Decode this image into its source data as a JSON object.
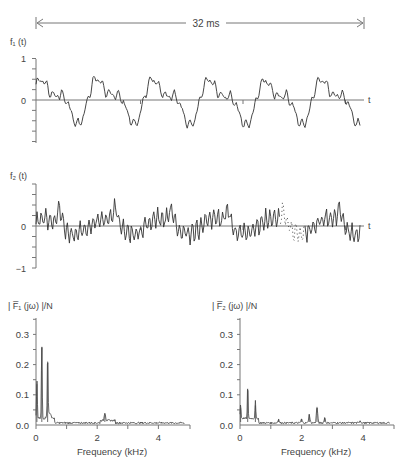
{
  "chart_data": [
    {
      "type": "line",
      "id": "f1",
      "title": "f1(t)",
      "ylabel": "f₁ (t)",
      "xlabel": "t",
      "duration_label": "32 ms",
      "duration_ms": 32,
      "ylim": [
        -1,
        1
      ],
      "yticks": [
        {
          "v": 1,
          "label": "1"
        },
        {
          "v": 0,
          "label": "0"
        }
      ],
      "minor_yticks": [
        0.75,
        0.5,
        0.25,
        -0.25,
        -0.5,
        -0.75,
        -1
      ],
      "xticks_ms": [
        10,
        20,
        30
      ],
      "periods": 6,
      "description": "quasi-periodic waveform, peaks ~0.6–0.75, troughs ~-0.55"
    },
    {
      "type": "line",
      "id": "f2",
      "title": "f2(t)",
      "ylabel": "f₂ (t)",
      "xlabel": "t",
      "ylim": [
        -1,
        1
      ],
      "yticks": [
        {
          "v": 0,
          "label": "0"
        },
        {
          "v": -1,
          "label": "−1"
        }
      ],
      "minor_yticks": [
        1,
        0.75,
        0.5,
        0.25,
        -0.25,
        -0.5,
        -0.75
      ],
      "xticks_ms": [
        10,
        20,
        30
      ],
      "periods": 6,
      "description": "noisy high-frequency waveform with spikes up to ~0.55, dotted gap near 24 ms"
    },
    {
      "type": "line",
      "id": "F1",
      "title": "|F̅₁(jω)|/N",
      "ylabel": "| F̅₁ (jω) |/N",
      "xlabel": "Frequency (kHz)",
      "xlim": [
        0,
        5
      ],
      "ylim": [
        0,
        0.35
      ],
      "xticks": [
        {
          "v": 0,
          "label": "0"
        },
        {
          "v": 2,
          "label": "2"
        },
        {
          "v": 4,
          "label": "4"
        }
      ],
      "yticks": [
        {
          "v": 0,
          "label": "0.0"
        },
        {
          "v": 0.1,
          "label": "0.1"
        },
        {
          "v": 0.2,
          "label": "0.2"
        },
        {
          "v": 0.3,
          "label": "0.3"
        }
      ],
      "peaks": [
        {
          "x": 0.03,
          "y": 0.135
        },
        {
          "x": 0.19,
          "y": 0.255
        },
        {
          "x": 0.38,
          "y": 0.21
        },
        {
          "x": 2.25,
          "y": 0.035
        }
      ]
    },
    {
      "type": "line",
      "id": "F2",
      "title": "|F̅₂(jω)|/N",
      "ylabel": "| F̅₂ (jω) |/N",
      "xlabel": "Frequency (kHz)",
      "xlim": [
        0,
        5
      ],
      "ylim": [
        0,
        0.35
      ],
      "xticks": [
        {
          "v": 0,
          "label": "0"
        },
        {
          "v": 2,
          "label": "2"
        },
        {
          "v": 4,
          "label": "4"
        }
      ],
      "yticks": [
        {
          "v": 0,
          "label": "0.0"
        },
        {
          "v": 0.1,
          "label": "0.1"
        },
        {
          "v": 0.2,
          "label": "0.2"
        },
        {
          "v": 0.3,
          "label": "0.3"
        }
      ],
      "peaks": [
        {
          "x": 0.02,
          "y": 0.055
        },
        {
          "x": 0.25,
          "y": 0.12
        },
        {
          "x": 0.5,
          "y": 0.065
        },
        {
          "x": 1.25,
          "y": 0.02
        },
        {
          "x": 2.0,
          "y": 0.02
        },
        {
          "x": 2.25,
          "y": 0.035
        },
        {
          "x": 2.5,
          "y": 0.06
        },
        {
          "x": 2.75,
          "y": 0.025
        },
        {
          "x": 3.9,
          "y": 0.015
        }
      ]
    }
  ]
}
